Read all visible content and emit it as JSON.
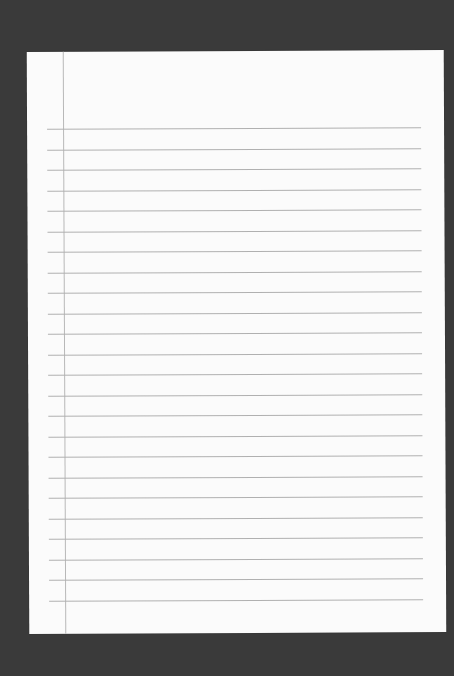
{
  "scene": {
    "description": "Blank sheet of ruled notebook paper on dark background",
    "background_color": "#3a3a3a",
    "paper_color": "#fbfbfb",
    "rule_color": "#b0b0b0",
    "margin_line_color": "#b8b8b8"
  },
  "paper": {
    "rule_count": 24,
    "first_rule_offset": 77,
    "rule_spacing": 20.5
  }
}
